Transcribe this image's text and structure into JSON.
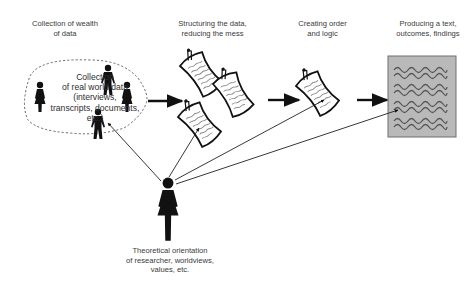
{
  "diagram": {
    "stages": [
      {
        "id": "collection",
        "label": "Collection of wealth\nof data"
      },
      {
        "id": "structuring",
        "label": "Structuring the data,\nreducing the mess"
      },
      {
        "id": "ordering",
        "label": "Creating order\nand logic"
      },
      {
        "id": "producing",
        "label": "Producing a text,\noutcomes, findings"
      }
    ],
    "cloud": {
      "text": "Collection\nof real world data\n(interviews,\ntranscripts, documents,\netc.)"
    },
    "researcher": {
      "label": "Theoretical orientation\nof researcher, worldviews,\nvalues, etc."
    },
    "colors": {
      "line": "#111111",
      "text": "#3a3a3a",
      "output_box_fill": "#b9b9b9",
      "output_box_border": "#6e6e6e",
      "wave": "#555555",
      "cloud_border": "#6a6a6a"
    }
  }
}
